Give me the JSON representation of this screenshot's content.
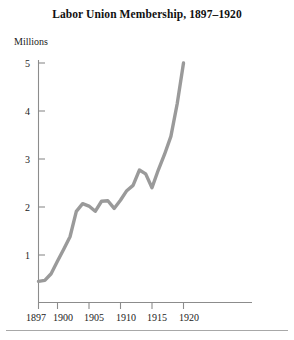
{
  "chart_data": {
    "type": "line",
    "title": "Labor Union Membership, 1897–1920",
    "ylabel": "Millions",
    "xlabel": "",
    "unit_note": "Millions",
    "xlim": [
      1897,
      1921
    ],
    "ylim": [
      0,
      5.2
    ],
    "grid": false,
    "legend": null,
    "line_color": "#9a9a9a",
    "axis_color": "#8c8c8c",
    "x_tick_labels": [
      "1897",
      "1900",
      "1905",
      "1910",
      "1915",
      "1920"
    ],
    "x_tick_values": [
      1897,
      1900,
      1905,
      1910,
      1915,
      1920
    ],
    "y_tick_labels": [
      "1",
      "2",
      "3",
      "4",
      "5"
    ],
    "y_tick_values": [
      1,
      2,
      3,
      4,
      5
    ],
    "x": [
      1897,
      1898,
      1899,
      1900,
      1901,
      1902,
      1903,
      1904,
      1905,
      1906,
      1907,
      1908,
      1909,
      1910,
      1911,
      1912,
      1913,
      1914,
      1915,
      1916,
      1917,
      1918,
      1919,
      1920
    ],
    "values": [
      0.45,
      0.47,
      0.61,
      0.87,
      1.12,
      1.38,
      1.91,
      2.07,
      2.02,
      1.91,
      2.12,
      2.13,
      1.97,
      2.14,
      2.34,
      2.45,
      2.77,
      2.69,
      2.4,
      2.77,
      3.1,
      3.47,
      4.15,
      5.0
    ],
    "series_name": "Labor union membership",
    "value_unit": "millions of members",
    "start_value": 0.45,
    "end_value": 5.0,
    "peak_pre_war": {
      "year": 1913,
      "value": 2.77
    },
    "dip": {
      "year": 1915,
      "value": 2.4
    }
  }
}
